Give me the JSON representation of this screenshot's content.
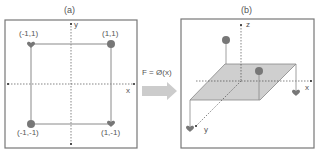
{
  "panel_a": {
    "title": "(a)",
    "axes": {
      "x": "x",
      "y": "y"
    },
    "points": [
      {
        "label": "(-1,1)",
        "shape": "heart"
      },
      {
        "label": "(1,1)",
        "shape": "circle"
      },
      {
        "label": "(-1,-1)",
        "shape": "circle"
      },
      {
        "label": "(1,-1)",
        "shape": "heart"
      }
    ]
  },
  "transform": {
    "label": "F = Ø(x)"
  },
  "panel_b": {
    "title": "(b)",
    "axes": {
      "x": "x",
      "y": "y",
      "z": "z"
    }
  },
  "colors": {
    "border": "#777777",
    "square": "#8a8a8a",
    "marker": "#777777",
    "plane": "#cfcfcf",
    "arrow": "#cccccc",
    "axis": "#333333"
  }
}
